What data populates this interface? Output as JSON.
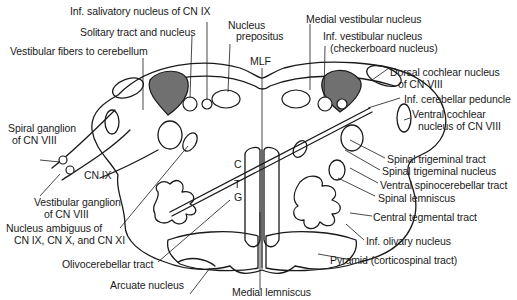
{
  "figure": {
    "type": "brainstem cross-section",
    "level": "rostral medulla",
    "shading_color": "#707070",
    "line_color": "#1a1a1a",
    "background": "#ffffff"
  },
  "labels": {
    "inf_salivatory": "Inf. salivatory nucleus of CN  IX",
    "solitary": "Solitary tract and nucleus",
    "vestibular_fibers": "Vestibular fibers to cerebellum",
    "nucleus_prepositus_1": "Nucleus",
    "nucleus_prepositus_2": "prepositus",
    "mlf": "MLF",
    "medial_vestibular": "Medial vestibular nucleus",
    "inf_vestibular_1": "Inf. vestibular nucleus",
    "inf_vestibular_2": "(checkerboard nucleus)",
    "dorsal_cochlear_1": "Dorsal cochlear nucleus",
    "dorsal_cochlear_2": "of CN VIII",
    "inf_cerebellar_peduncle": "Inf. cerebellar peduncle",
    "ventral_cochlear_1": "Ventral cochlear",
    "ventral_cochlear_2": "nucleus of CN VIII",
    "spiral_ganglion_1": "Spiral ganglion",
    "spiral_ganglion_2": "of CN VIII",
    "cn_ix": "CN IX",
    "vestibular_ganglion_1": "Vestibular ganglion",
    "vestibular_ganglion_2": "of CN  VIII",
    "nucleus_ambiguus_1": "Nucleus ambiguus of",
    "nucleus_ambiguus_2": "CN IX, CN X, and CN XI",
    "spinal_trigeminal_tract": "Spinal trigeminal tract",
    "spinal_trigeminal_nucleus": "Spinal trigeminal nucleus",
    "ventral_spinocerebellar": "Ventral spinocerebellar tract",
    "spinal_lemniscus": "Spinal lemniscus",
    "central_tegmental": "Central tegmental tract",
    "inf_olivary": "Inf. olivary nucleus",
    "pyramid": "Pyramid (corticospinal tract)",
    "olivocerebellar": "Olivocerebellar tract",
    "arcuate": "Arcuate nucleus",
    "medial_lemniscus": "Medial lemniscus",
    "ctg_c": "C",
    "ctg_t": "T",
    "ctg_g": "G"
  }
}
